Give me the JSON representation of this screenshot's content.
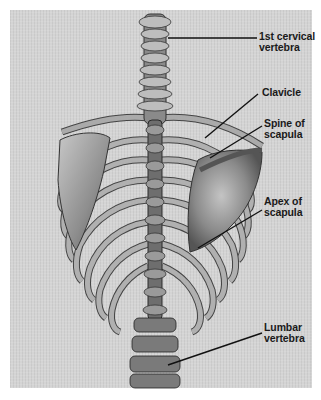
{
  "figure": {
    "labels": [
      {
        "id": "cervical",
        "line1": "1st cervical",
        "line2": "vertebra"
      },
      {
        "id": "clavicle",
        "line1": "Clavicle",
        "line2": ""
      },
      {
        "id": "spine_scapula",
        "line1": "Spine of",
        "line2": "scapula"
      },
      {
        "id": "apex_scapula",
        "line1": "Apex of",
        "line2": "scapula"
      },
      {
        "id": "lumbar",
        "line1": "Lumbar",
        "line2": "vertebra"
      }
    ]
  },
  "colors": {
    "panel": "#d4d4d4",
    "bone_light": "#b8b8b8",
    "bone_mid": "#8a8a8a",
    "bone_dark": "#3a3a3a",
    "leader": "#111111"
  }
}
